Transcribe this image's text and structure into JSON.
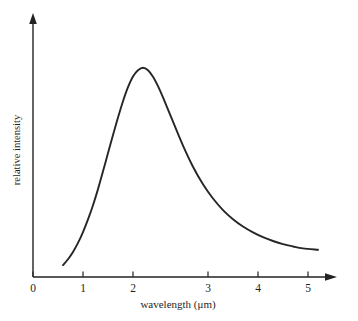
{
  "chart_data": {
    "type": "line",
    "title": "",
    "xlabel": "wavelength (μm)",
    "ylabel": "relative intensity",
    "xlim": [
      0,
      5.4
    ],
    "ylim": [
      0,
      1.08
    ],
    "xticks": [
      0,
      1,
      2,
      3,
      4,
      5
    ],
    "xtick_labels": [
      "0",
      "1",
      "2",
      "3",
      "4",
      "5"
    ],
    "yticks": [],
    "ytick_labels": [],
    "grid": false,
    "legend": false,
    "series": [
      {
        "name": "spectral radiance",
        "x": [
          0.6,
          0.7,
          0.8,
          0.9,
          1.0,
          1.1,
          1.2,
          1.3,
          1.4,
          1.5,
          1.6,
          1.7,
          1.8,
          1.9,
          2.0,
          2.1,
          2.2,
          2.3,
          2.4,
          2.5,
          2.6,
          2.8,
          3.0,
          3.2,
          3.4,
          3.6,
          3.8,
          4.0,
          4.2,
          4.4,
          4.6,
          4.8,
          5.0,
          5.2,
          5.4,
          5.7
        ],
        "y": [
          0.057,
          0.085,
          0.12,
          0.163,
          0.215,
          0.275,
          0.343,
          0.42,
          0.505,
          0.592,
          0.678,
          0.762,
          0.84,
          0.907,
          0.958,
          0.988,
          1.0,
          0.988,
          0.957,
          0.912,
          0.858,
          0.742,
          0.628,
          0.527,
          0.443,
          0.375,
          0.32,
          0.276,
          0.241,
          0.213,
          0.19,
          0.172,
          0.157,
          0.146,
          0.137,
          0.13
        ]
      }
    ],
    "annotations": {
      "peak_wavelength": "2.2",
      "curve_start_x": "0.60",
      "curve_end_x": "5.70"
    }
  },
  "axes": {
    "x_axis_name": "wavelength-axis",
    "y_axis_name": "relative-intensity-axis",
    "x_arrow": "right-arrow",
    "y_arrow": "up-arrow"
  },
  "colors": {
    "background": "#ffffff",
    "curve": "#262626",
    "axis": "#232323",
    "text": "#1f1f1f"
  }
}
